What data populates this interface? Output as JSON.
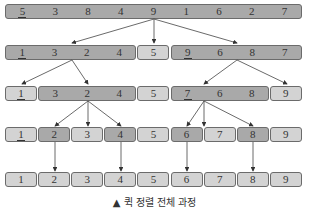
{
  "rows": [
    {
      "groups": [
        {
          "values": [
            "5",
            "3",
            "8",
            "4",
            "9",
            "1",
            "6",
            "2",
            "7"
          ],
          "shade": "dark",
          "pivot_index": 0
        }
      ]
    },
    {
      "groups": [
        {
          "values": [
            "1",
            "3",
            "2",
            "4"
          ],
          "shade": "dark",
          "pivot_index": 0
        },
        {
          "values": [
            "5"
          ],
          "shade": "light"
        },
        {
          "values": [
            "9",
            "6",
            "8",
            "7"
          ],
          "shade": "dark",
          "pivot_index": 0
        }
      ]
    },
    {
      "groups": [
        {
          "values": [
            "1"
          ],
          "shade": "light",
          "pivot_index": 0
        },
        {
          "values": [
            "3",
            "2",
            "4"
          ],
          "shade": "dark"
        },
        {
          "values": [
            "5"
          ],
          "shade": "light"
        },
        {
          "values": [
            "7",
            "6",
            "8"
          ],
          "shade": "dark",
          "pivot_index": 0
        },
        {
          "values": [
            "9"
          ],
          "shade": "light"
        }
      ]
    },
    {
      "groups": [
        {
          "values": [
            "1"
          ],
          "shade": "light",
          "pivot_index": 0
        },
        {
          "values": [
            "2"
          ],
          "shade": "dark"
        },
        {
          "values": [
            "3"
          ],
          "shade": "light"
        },
        {
          "values": [
            "4"
          ],
          "shade": "dark"
        },
        {
          "values": [
            "5"
          ],
          "shade": "light"
        },
        {
          "values": [
            "6"
          ],
          "shade": "dark"
        },
        {
          "values": [
            "7"
          ],
          "shade": "light"
        },
        {
          "values": [
            "8"
          ],
          "shade": "dark"
        },
        {
          "values": [
            "9"
          ],
          "shade": "light"
        }
      ]
    },
    {
      "groups": [
        {
          "values": [
            "1"
          ],
          "shade": "light"
        },
        {
          "values": [
            "2"
          ],
          "shade": "light"
        },
        {
          "values": [
            "3"
          ],
          "shade": "light"
        },
        {
          "values": [
            "4"
          ],
          "shade": "light"
        },
        {
          "values": [
            "5"
          ],
          "shade": "light"
        },
        {
          "values": [
            "6"
          ],
          "shade": "light"
        },
        {
          "values": [
            "7"
          ],
          "shade": "light"
        },
        {
          "values": [
            "8"
          ],
          "shade": "light"
        },
        {
          "values": [
            "9"
          ],
          "shade": "light"
        }
      ]
    }
  ],
  "caption": "▲ 퀵 정렬 전체 과정",
  "colors": {
    "dark": "#a9a9a9",
    "light": "#d3d3d3",
    "border": "#6b6b6b"
  }
}
